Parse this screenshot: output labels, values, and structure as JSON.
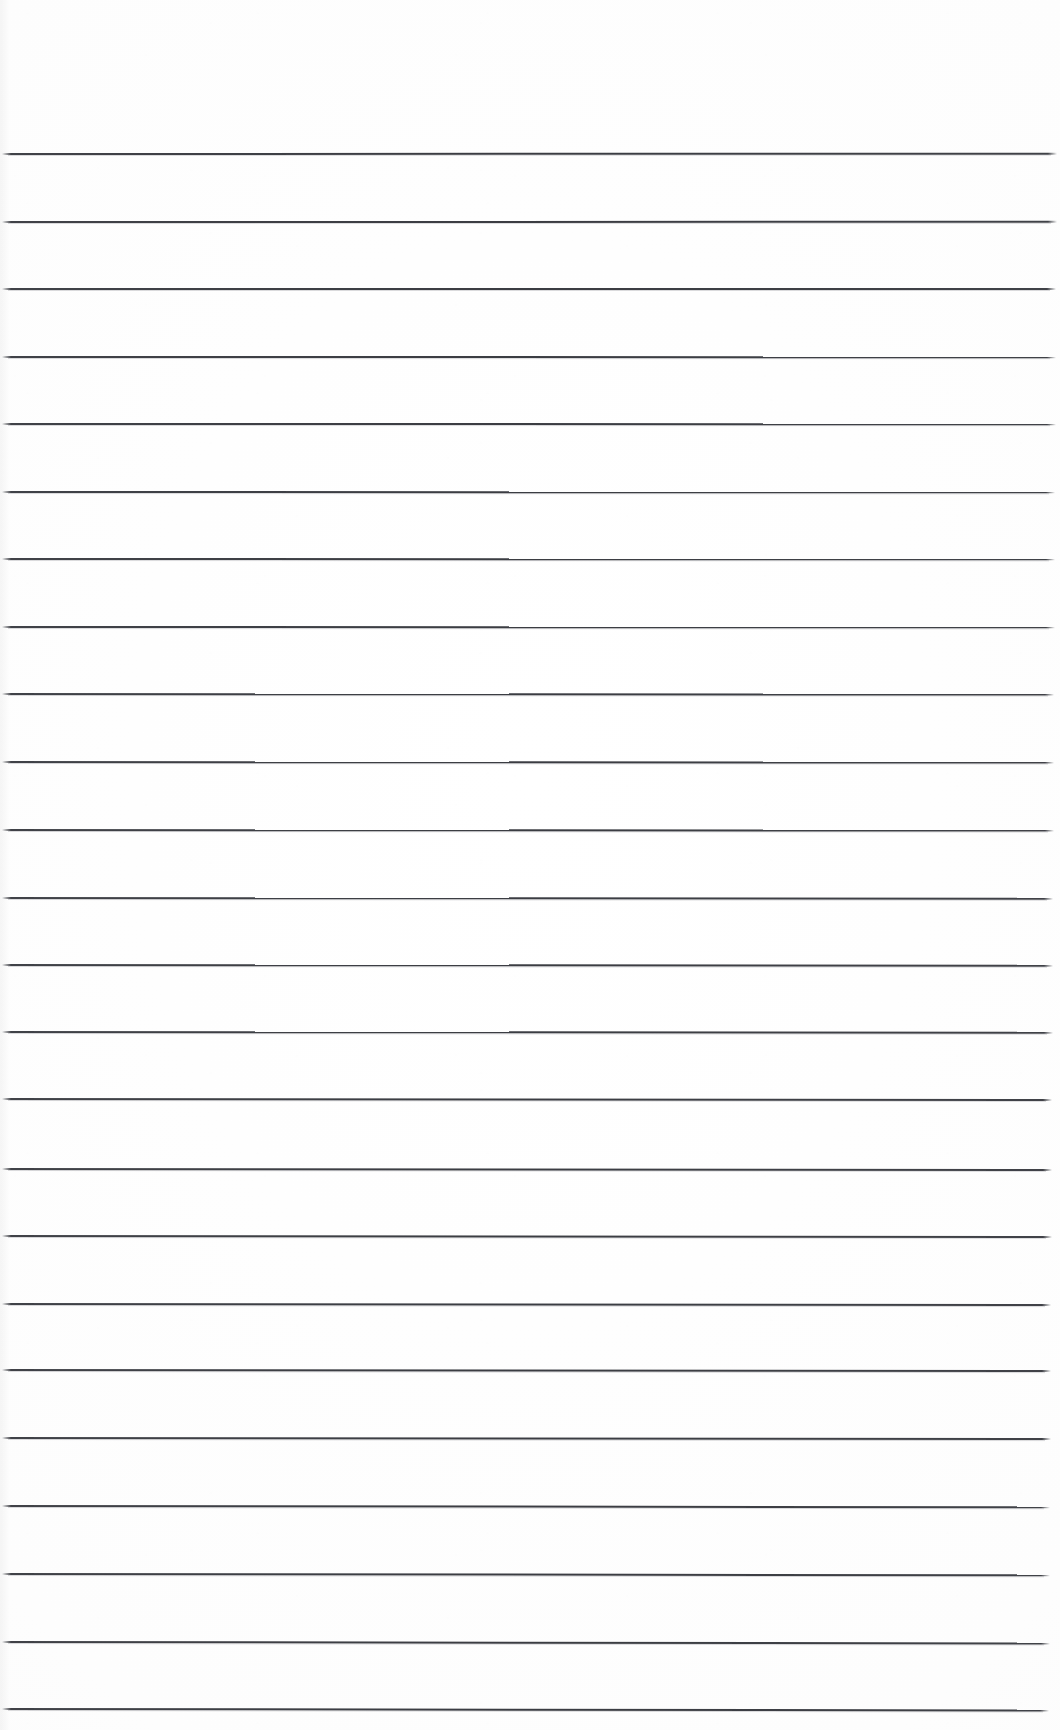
{
  "document": {
    "kind": "scanned-blank-lined-paper",
    "title": "Blank Lined Notebook Page",
    "page_width": 1060,
    "page_height": 1730,
    "background_color": "#fefefe",
    "paper_tone": "#fbfbfb",
    "has_text": false,
    "has_handwriting": false,
    "has_header": false,
    "has_footer": false,
    "has_page_number": false,
    "has_margin_rule": false,
    "notes": "Empty ruled page; no written or printed content other than the horizontal rules."
  },
  "rules": {
    "label": "horizontal ruled lines",
    "count": 24,
    "color": "#30323 8",
    "ink_color": "#303238",
    "thickness_px": 2,
    "first_line_y": 153,
    "spacing_px": 67.6,
    "left_x": 2,
    "right_x": 1057,
    "skew_note": "slight scanner skew; lines drift a fraction of a pixel downward toward the right",
    "lines": [
      {
        "index": 1,
        "y": 153,
        "left_x": 2,
        "right_x": 1057,
        "skew_deg": -0.02
      },
      {
        "index": 2,
        "y": 221,
        "left_x": 2,
        "right_x": 1057,
        "skew_deg": -0.01
      },
      {
        "index": 3,
        "y": 288,
        "left_x": 2,
        "right_x": 1056,
        "skew_deg": 0.0
      },
      {
        "index": 4,
        "y": 356,
        "left_x": 2,
        "right_x": 1056,
        "skew_deg": 0.01
      },
      {
        "index": 5,
        "y": 423,
        "left_x": 2,
        "right_x": 1056,
        "skew_deg": 0.01
      },
      {
        "index": 6,
        "y": 491,
        "left_x": 2,
        "right_x": 1055,
        "skew_deg": 0.02
      },
      {
        "index": 7,
        "y": 558,
        "left_x": 2,
        "right_x": 1055,
        "skew_deg": 0.02
      },
      {
        "index": 8,
        "y": 626,
        "left_x": 2,
        "right_x": 1055,
        "skew_deg": 0.02
      },
      {
        "index": 9,
        "y": 693,
        "left_x": 2,
        "right_x": 1054,
        "skew_deg": 0.03
      },
      {
        "index": 10,
        "y": 761,
        "left_x": 2,
        "right_x": 1054,
        "skew_deg": 0.03
      },
      {
        "index": 11,
        "y": 829,
        "left_x": 2,
        "right_x": 1054,
        "skew_deg": 0.03
      },
      {
        "index": 12,
        "y": 897,
        "left_x": 2,
        "right_x": 1053,
        "skew_deg": 0.04
      },
      {
        "index": 13,
        "y": 964,
        "left_x": 2,
        "right_x": 1053,
        "skew_deg": 0.04
      },
      {
        "index": 14,
        "y": 1031,
        "left_x": 2,
        "right_x": 1053,
        "skew_deg": 0.04
      },
      {
        "index": 15,
        "y": 1098,
        "left_x": 2,
        "right_x": 1052,
        "skew_deg": 0.05
      },
      {
        "index": 16,
        "y": 1168,
        "left_x": 2,
        "right_x": 1052,
        "skew_deg": 0.05
      },
      {
        "index": 17,
        "y": 1235,
        "left_x": 2,
        "right_x": 1052,
        "skew_deg": 0.05
      },
      {
        "index": 18,
        "y": 1303,
        "left_x": 2,
        "right_x": 1051,
        "skew_deg": 0.06
      },
      {
        "index": 19,
        "y": 1369,
        "left_x": 2,
        "right_x": 1051,
        "skew_deg": 0.06
      },
      {
        "index": 20,
        "y": 1437,
        "left_x": 2,
        "right_x": 1051,
        "skew_deg": 0.06
      },
      {
        "index": 21,
        "y": 1505,
        "left_x": 2,
        "right_x": 1050,
        "skew_deg": 0.07
      },
      {
        "index": 22,
        "y": 1573,
        "left_x": 2,
        "right_x": 1050,
        "skew_deg": 0.07
      },
      {
        "index": 23,
        "y": 1641,
        "left_x": 2,
        "right_x": 1050,
        "skew_deg": 0.08
      },
      {
        "index": 24,
        "y": 1708,
        "left_x": 2,
        "right_x": 1049,
        "skew_deg": 0.08
      }
    ]
  },
  "margins": {
    "top_blank_px": 153,
    "bottom_blank_px": 22,
    "left_blank_px": 2,
    "right_blank_px": 3
  }
}
